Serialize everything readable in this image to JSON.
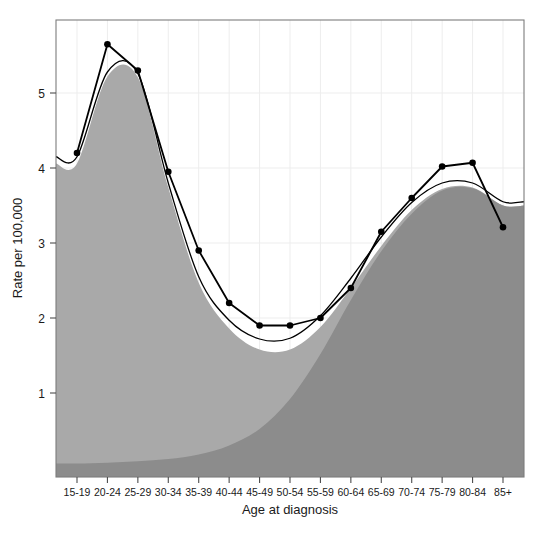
{
  "figure": {
    "top_clipped_text": "",
    "background_color": "#ffffff",
    "plot_border_color": "#7d7d7d",
    "grid_color": "#ededed"
  },
  "chart_data": {
    "type": "area",
    "title": "",
    "subtitle": "",
    "xlabel": "Age at diagnosis",
    "ylabel": "Rate per 100,000",
    "grid": true,
    "legend": "none",
    "categories": [
      "15-19",
      "20-24",
      "25-29",
      "30-34",
      "35-39",
      "40-44",
      "45-49",
      "50-54",
      "55-59",
      "60-64",
      "65-69",
      "70-74",
      "75-79",
      "80-84",
      "85+"
    ],
    "xlim": [
      0,
      14
    ],
    "ylim": [
      0,
      6.08
    ],
    "ytick_values": [
      1,
      2,
      3,
      4,
      5
    ],
    "ytick_labels": [
      "1",
      "2",
      "3",
      "4",
      "5"
    ],
    "series": [
      {
        "name": "Observed rate",
        "style": "line-with-points",
        "color": "#000000",
        "marker": "filled-circle",
        "values": [
          4.2,
          5.65,
          5.3,
          3.95,
          2.9,
          2.2,
          1.9,
          1.9,
          2.0,
          2.4,
          3.15,
          3.6,
          4.02,
          4.07,
          3.21
        ]
      },
      {
        "name": "Fitted mixture (total)",
        "style": "smooth-line",
        "color": "#000000",
        "marker": "none",
        "values": [
          4.15,
          5.28,
          5.26,
          3.8,
          2.55,
          1.97,
          1.72,
          1.73,
          2.03,
          2.53,
          3.08,
          3.54,
          3.8,
          3.8,
          3.55
        ]
      },
      {
        "name": "Mixture density (both components)",
        "style": "filled-area",
        "color": "#a9a9a9",
        "values": [
          4.06,
          5.22,
          5.21,
          3.74,
          2.47,
          1.86,
          1.58,
          1.58,
          1.88,
          2.4,
          2.96,
          3.44,
          3.72,
          3.74,
          3.5
        ]
      },
      {
        "name": "Older-age component",
        "style": "filled-area",
        "color": "#8c8c8c",
        "values": [
          0.06,
          0.07,
          0.09,
          0.12,
          0.18,
          0.3,
          0.52,
          0.92,
          1.52,
          2.24,
          2.89,
          3.39,
          3.7,
          3.73,
          3.5
        ]
      }
    ]
  }
}
